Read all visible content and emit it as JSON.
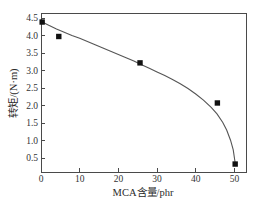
{
  "chart_data": {
    "type": "scatter",
    "title": "",
    "xlabel": "MCA含量/phr",
    "ylabel": "转矩/(N·m)",
    "xlim": [
      0,
      53
    ],
    "ylim": [
      0.25,
      4.65
    ],
    "xticks": [
      0,
      10,
      20,
      30,
      40,
      50
    ],
    "xticklabels": [
      "0",
      "10",
      "20",
      "30",
      "40",
      "50"
    ],
    "yticks": [
      0.5,
      1.0,
      1.5,
      2.0,
      2.5,
      3.0,
      3.5,
      4.0,
      4.5
    ],
    "yticklabels": [
      "0.5",
      "1.0",
      "1.5",
      "2.0",
      "2.5",
      "3.0",
      "3.5",
      "4.0",
      "4.5"
    ],
    "grid": false,
    "legend": null,
    "marker": "filled-square",
    "x": [
      0.3,
      4.6,
      25.6,
      45.6,
      50.2
    ],
    "values": [
      4.4,
      4.0,
      3.27,
      2.16,
      0.47
    ],
    "series": [
      {
        "name": "转矩",
        "x": [
          0.3,
          4.6,
          25.6,
          45.6,
          50.2
        ],
        "values": [
          4.4,
          4.0,
          3.27,
          2.16,
          0.47
        ]
      }
    ],
    "fit_curve": [
      [
        0.3,
        4.4
      ],
      [
        2.0,
        4.31
      ],
      [
        4.0,
        4.21
      ],
      [
        6.0,
        4.12
      ],
      [
        8.0,
        4.03
      ],
      [
        10.0,
        3.95
      ],
      [
        12.0,
        3.86
      ],
      [
        14.0,
        3.77
      ],
      [
        16.0,
        3.68
      ],
      [
        18.0,
        3.59
      ],
      [
        20.0,
        3.5
      ],
      [
        22.0,
        3.41
      ],
      [
        24.0,
        3.32
      ],
      [
        26.0,
        3.22
      ],
      [
        28.0,
        3.12
      ],
      [
        30.0,
        3.02
      ],
      [
        32.0,
        2.92
      ],
      [
        34.0,
        2.81
      ],
      [
        36.0,
        2.69
      ],
      [
        38.0,
        2.56
      ],
      [
        40.0,
        2.41
      ],
      [
        42.0,
        2.24
      ],
      [
        44.0,
        2.04
      ],
      [
        45.5,
        1.86
      ],
      [
        47.0,
        1.62
      ],
      [
        48.0,
        1.41
      ],
      [
        49.0,
        1.13
      ],
      [
        49.7,
        0.86
      ],
      [
        50.2,
        0.5
      ]
    ]
  },
  "caption": {
    "text": ""
  }
}
